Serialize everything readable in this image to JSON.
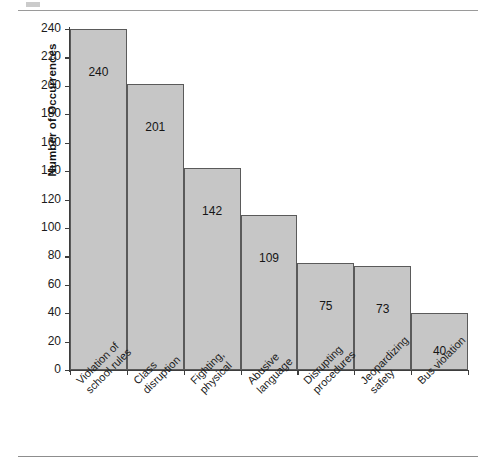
{
  "page": {
    "background_color": "#ffffff",
    "rule_color": "#8d8d8d"
  },
  "chart_data": {
    "type": "bar",
    "title": "",
    "xlabel": "",
    "ylabel": "Number of Occurrences",
    "categories": [
      "Violation of\nschool rules",
      "Class\ndisruption",
      "Fighting,\nphysical",
      "Abusive\nlanguage",
      "Disrupting\nprocedures",
      "Jeopardizing\nsafety",
      "Bus violation"
    ],
    "category_lines": [
      [
        "Violation of",
        "school rules"
      ],
      [
        "Class",
        "disruption"
      ],
      [
        "Fighting,",
        "physical"
      ],
      [
        "Abusive",
        "language"
      ],
      [
        "Disrupting",
        "procedures"
      ],
      [
        "Jeopardizing",
        "safety"
      ],
      [
        "Bus violation"
      ]
    ],
    "values": [
      240,
      201,
      142,
      109,
      75,
      73,
      40
    ],
    "data_labels": [
      "240",
      "201",
      "142",
      "109",
      "75",
      "73",
      "40"
    ],
    "ylim": [
      0,
      240
    ],
    "ytick_step": 20,
    "yticks": [
      0,
      20,
      40,
      60,
      80,
      100,
      120,
      140,
      160,
      180,
      200,
      220,
      240
    ],
    "ytick_labels": [
      "0",
      "20",
      "40",
      "60",
      "80",
      "100",
      "120",
      "140",
      "160",
      "180",
      "200",
      "220",
      "240"
    ],
    "grid": false,
    "legend": null,
    "bar_fill_color": "#c6c6c6",
    "bar_edge_color": "#5a5a5a",
    "axis_color": "#3d3d3d",
    "text_color": "#1b1b1b",
    "xtick_label_rotation": -45
  }
}
